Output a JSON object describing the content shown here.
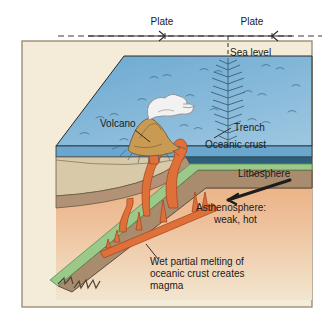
{
  "figure": {
    "type": "geology-block-diagram",
    "background_color": "#f4ecd8",
    "border_color": "#9a8f78"
  },
  "labels": {
    "plate_left": "Plate",
    "plate_right": "Plate",
    "sea_level": "Sea level",
    "volcano": "Volcano",
    "trench": "Trench",
    "oceanic_crust": "Oceanic crust",
    "lithosphere": "Lithosphere",
    "asthenosphere_line1": "Asthenosphere:",
    "asthenosphere_line2": "weak, hot",
    "magma_line1": "Wet partial melting of",
    "magma_line2": "oceanic crust creates",
    "magma_line3": "magma"
  },
  "colors": {
    "ocean_surface": "#7fb4d8",
    "ocean_water": "#bfd9ea",
    "ocean_front_band": "#5a9ec4",
    "oceanic_crust": "#2e5f7a",
    "lithosphere_green": "#9bc98a",
    "lithosphere_mantle": "#a98b6e",
    "asthenosphere_top": "#e9a877",
    "asthenosphere_bottom": "#f0e2c8",
    "sediment_tan": "#d8c9a8",
    "magma_orange": "#e0703a",
    "island_tan": "#c89a52",
    "plume_white": "#f2f2f2",
    "outline": "#2b2b2b"
  },
  "icons": {
    "plate_arrow_left": "arrow-left-icon",
    "plate_arrow_right": "arrow-right-icon",
    "volcano_plume": "smoke-plume-icon",
    "slab_arrow": "slab-motion-arrow-icon",
    "slab_tip": "jagged-slab-tip-icon"
  }
}
